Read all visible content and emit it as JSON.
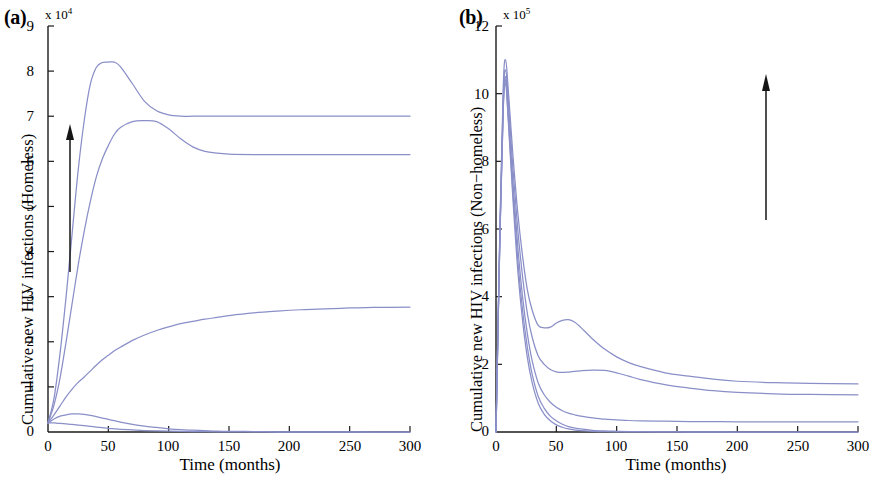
{
  "figure": {
    "background_color": "#ffffff",
    "curve_color": "#8a8fc8",
    "axis_color": "#1a1a1a",
    "arrow_color": "#151515"
  },
  "panels": [
    {
      "tag": "(a)",
      "exp_mantissa": "x 10",
      "exp_power": "4",
      "ylabel": "Cumulative new HIV infections  (Homeless)",
      "xlabel": "Time (months)",
      "xticks": [
        "0",
        "50",
        "100",
        "150",
        "200",
        "250",
        "300"
      ],
      "yticks": [
        "0",
        "1",
        "2",
        "3",
        "4",
        "5",
        "6",
        "7",
        "8",
        "9"
      ],
      "arrow": {
        "direction": "up",
        "name": "increasing-parameter-arrow"
      }
    },
    {
      "tag": "(b)",
      "exp_mantissa": "x 10",
      "exp_power": "5",
      "ylabel": "Cumulative new HIV infections  (Non−homeless)",
      "xlabel": "Time (months)",
      "xticks": [
        "0",
        "50",
        "100",
        "150",
        "200",
        "250",
        "300"
      ],
      "yticks": [
        "0",
        "2",
        "4",
        "6",
        "8",
        "10",
        "12"
      ],
      "arrow": {
        "direction": "up",
        "name": "increasing-parameter-arrow"
      }
    }
  ],
  "chart_data": [
    {
      "type": "line",
      "panel": "(a)",
      "title": "",
      "xlabel": "Time (months)",
      "ylabel": "Cumulative new HIV infections  (Homeless)",
      "xlim": [
        0,
        300
      ],
      "ylim": [
        0,
        9
      ],
      "y_scale_factor": 10000,
      "y_scale_label": "x 10^4",
      "xticks": [
        0,
        50,
        100,
        150,
        200,
        250,
        300
      ],
      "yticks": [
        0,
        1,
        2,
        3,
        4,
        5,
        6,
        7,
        8,
        9
      ],
      "grid": false,
      "legend": null,
      "annotation": "upward arrow indicating increasing parameter",
      "x": [
        0,
        5,
        10,
        15,
        20,
        25,
        30,
        35,
        40,
        45,
        50,
        55,
        60,
        70,
        80,
        90,
        100,
        110,
        120,
        130,
        140,
        150,
        170,
        190,
        210,
        230,
        250,
        270,
        300
      ],
      "series": [
        {
          "name": "curve-1-highest",
          "values": [
            0.2,
            0.75,
            1.75,
            3.0,
            4.4,
            5.8,
            6.9,
            7.7,
            8.08,
            8.19,
            8.2,
            8.2,
            8.1,
            7.72,
            7.33,
            7.12,
            7.03,
            7.0,
            7.0,
            7.0,
            7.0,
            7.0,
            7.0,
            7.0,
            7.0,
            7.0,
            7.0,
            7.0,
            7.0
          ]
        },
        {
          "name": "curve-2",
          "values": [
            0.2,
            0.6,
            1.2,
            2.0,
            2.85,
            3.7,
            4.45,
            5.1,
            5.65,
            6.05,
            6.35,
            6.6,
            6.75,
            6.88,
            6.9,
            6.88,
            6.72,
            6.5,
            6.32,
            6.22,
            6.18,
            6.16,
            6.15,
            6.15,
            6.15,
            6.15,
            6.15,
            6.15,
            6.15
          ]
        },
        {
          "name": "curve-3-middle",
          "values": [
            0.2,
            0.38,
            0.58,
            0.78,
            0.95,
            1.1,
            1.22,
            1.35,
            1.48,
            1.6,
            1.7,
            1.8,
            1.88,
            2.03,
            2.15,
            2.25,
            2.33,
            2.4,
            2.45,
            2.5,
            2.54,
            2.58,
            2.64,
            2.68,
            2.71,
            2.73,
            2.75,
            2.76,
            2.77
          ]
        },
        {
          "name": "curve-4",
          "values": [
            0.2,
            0.29,
            0.35,
            0.38,
            0.4,
            0.4,
            0.39,
            0.37,
            0.34,
            0.31,
            0.28,
            0.25,
            0.22,
            0.17,
            0.13,
            0.1,
            0.07,
            0.05,
            0.04,
            0.03,
            0.02,
            0.015,
            0.01,
            0.005,
            0.003,
            0.002,
            0.001,
            0.0,
            0.0
          ]
        },
        {
          "name": "curve-5-lowest",
          "values": [
            0.2,
            0.2,
            0.19,
            0.18,
            0.17,
            0.155,
            0.14,
            0.125,
            0.11,
            0.095,
            0.08,
            0.07,
            0.06,
            0.045,
            0.033,
            0.024,
            0.018,
            0.013,
            0.009,
            0.006,
            0.004,
            0.003,
            0.001,
            0.0,
            0.0,
            0.0,
            0.0,
            0.0,
            0.0
          ]
        }
      ]
    },
    {
      "type": "line",
      "panel": "(b)",
      "title": "",
      "xlabel": "Time (months)",
      "ylabel": "Cumulative new HIV infections  (Non-homeless)",
      "xlim": [
        0,
        300
      ],
      "ylim": [
        0,
        12
      ],
      "y_scale_factor": 100000,
      "y_scale_label": "x 10^5",
      "xticks": [
        0,
        50,
        100,
        150,
        200,
        250,
        300
      ],
      "yticks": [
        0,
        2,
        4,
        6,
        8,
        10,
        12
      ],
      "grid": false,
      "legend": null,
      "annotation": "upward arrow indicating increasing parameter",
      "x": [
        0,
        3,
        6,
        8,
        10,
        14,
        18,
        22,
        26,
        30,
        35,
        40,
        45,
        50,
        55,
        60,
        65,
        70,
        80,
        90,
        100,
        110,
        120,
        140,
        160,
        180,
        200,
        230,
        260,
        300
      ],
      "series": [
        {
          "name": "curve-1-highest",
          "values": [
            0.0,
            5.6,
            10.2,
            11.0,
            10.2,
            8.2,
            6.5,
            5.2,
            4.2,
            3.6,
            3.15,
            3.08,
            3.1,
            3.22,
            3.3,
            3.32,
            3.25,
            3.1,
            2.75,
            2.45,
            2.22,
            2.05,
            1.93,
            1.75,
            1.65,
            1.56,
            1.5,
            1.46,
            1.44,
            1.42
          ]
        },
        {
          "name": "curve-2",
          "values": [
            0.0,
            5.5,
            9.9,
            10.7,
            9.9,
            7.8,
            6.0,
            4.6,
            3.5,
            2.8,
            2.25,
            2.0,
            1.85,
            1.78,
            1.76,
            1.77,
            1.79,
            1.81,
            1.83,
            1.82,
            1.75,
            1.65,
            1.55,
            1.4,
            1.3,
            1.22,
            1.17,
            1.13,
            1.11,
            1.1
          ]
        },
        {
          "name": "curve-3-middle",
          "values": [
            0.0,
            5.4,
            9.7,
            10.5,
            9.6,
            7.4,
            5.5,
            4.0,
            2.9,
            2.1,
            1.45,
            1.1,
            0.88,
            0.73,
            0.63,
            0.56,
            0.51,
            0.47,
            0.42,
            0.38,
            0.36,
            0.34,
            0.33,
            0.32,
            0.31,
            0.305,
            0.3,
            0.3,
            0.3,
            0.3
          ]
        },
        {
          "name": "curve-4",
          "values": [
            0.0,
            5.35,
            9.6,
            10.4,
            9.4,
            7.1,
            5.1,
            3.6,
            2.5,
            1.7,
            1.05,
            0.7,
            0.47,
            0.33,
            0.23,
            0.16,
            0.12,
            0.09,
            0.05,
            0.03,
            0.02,
            0.012,
            0.008,
            0.004,
            0.002,
            0.001,
            0.0,
            0.0,
            0.0,
            0.0
          ]
        },
        {
          "name": "curve-5-lowest",
          "values": [
            0.0,
            5.3,
            9.5,
            10.3,
            9.3,
            6.9,
            4.8,
            3.3,
            2.2,
            1.45,
            0.85,
            0.52,
            0.33,
            0.21,
            0.14,
            0.09,
            0.06,
            0.04,
            0.02,
            0.01,
            0.005,
            0.003,
            0.002,
            0.001,
            0.0,
            0.0,
            0.0,
            0.0,
            0.0,
            0.0
          ]
        }
      ]
    }
  ]
}
